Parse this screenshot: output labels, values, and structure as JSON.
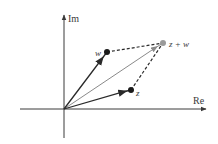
{
  "diagram": {
    "axes": {
      "real_label": "Re",
      "imag_label": "Im"
    },
    "points": {
      "origin": {
        "x": 64,
        "y": 109
      },
      "w": {
        "label": "w",
        "x": 107,
        "y": 52
      },
      "z": {
        "label": "z",
        "x": 131,
        "y": 90
      },
      "sum": {
        "label": "z + w",
        "x": 163,
        "y": 43
      }
    },
    "colors": {
      "axis": "#3a3a3a",
      "vector_dark": "#2a2a2a",
      "vector_sum": "#8a8a8a",
      "point_sum": "#9a9a9a",
      "dashed": "#2a2a2a"
    }
  }
}
